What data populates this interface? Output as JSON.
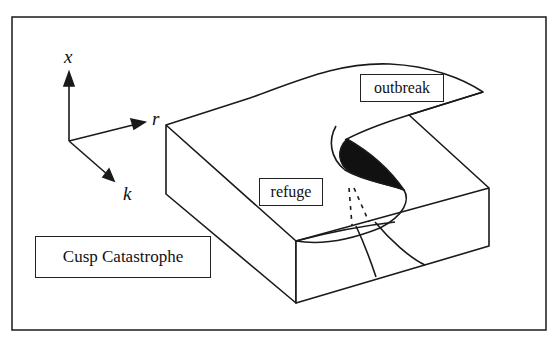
{
  "diagram": {
    "title": "Cusp Catastrophe",
    "axes": {
      "x": "x",
      "r": "r",
      "k": "k"
    },
    "regions": {
      "outbreak": "outbreak",
      "refuge": "refuge"
    },
    "colors": {
      "line": "#1a1a1a",
      "background": "#ffffff",
      "fold_fill": "#111111"
    }
  }
}
